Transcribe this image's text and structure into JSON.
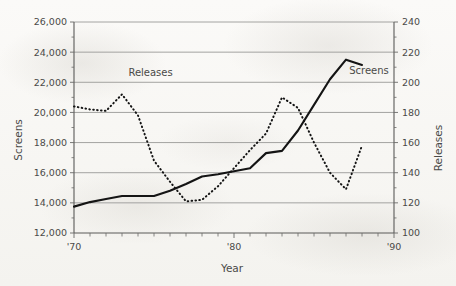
{
  "chart_data": {
    "type": "line",
    "title": "",
    "subtitle": "",
    "xlabel": "Year",
    "ylabel": "Screens",
    "y2label": "Releases",
    "grid": true,
    "legend_position": "inline-labels",
    "xlim": [
      1970,
      1990
    ],
    "ylim": [
      12000,
      26000
    ],
    "y2lim": [
      100,
      240
    ],
    "x_tick_labels": [
      "'70",
      "'80",
      "'90"
    ],
    "x_major_ticks": [
      1970,
      1980,
      1990
    ],
    "x_minor_ticks": [
      1971,
      1972,
      1973,
      1974,
      1975,
      1976,
      1977,
      1978,
      1979,
      1981,
      1982,
      1983,
      1984,
      1985,
      1986,
      1987,
      1988,
      1989
    ],
    "y_tick_labels": [
      "12,000",
      "14,000",
      "16,000",
      "18,000",
      "20,000",
      "22,000",
      "24,000",
      "26,000"
    ],
    "y_ticks": [
      12000,
      14000,
      16000,
      18000,
      20000,
      22000,
      24000,
      26000
    ],
    "y2_tick_labels": [
      "100",
      "120",
      "140",
      "160",
      "180",
      "200",
      "220",
      "240"
    ],
    "y2_ticks": [
      100,
      120,
      140,
      160,
      180,
      200,
      220,
      240
    ],
    "x": [
      1970,
      1971,
      1972,
      1973,
      1974,
      1975,
      1976,
      1977,
      1978,
      1979,
      1980,
      1981,
      1982,
      1983,
      1984,
      1985,
      1986,
      1987,
      1988
    ],
    "series": [
      {
        "name": "Screens",
        "axis": "left",
        "style": "solid",
        "label_text": "Screens",
        "values": [
          13750,
          14050,
          14250,
          14450,
          14450,
          14450,
          14800,
          15250,
          15750,
          15900,
          16100,
          16300,
          17300,
          17450,
          18800,
          20500,
          22200,
          23500,
          23150
        ]
      },
      {
        "name": "Releases",
        "axis": "right",
        "style": "dotted",
        "label_text": "Releases",
        "values": [
          184,
          182,
          181,
          192,
          178,
          148,
          134,
          121,
          122,
          131,
          143,
          155,
          166,
          190,
          183,
          160,
          140,
          129,
          158
        ]
      }
    ],
    "annotations": [
      {
        "text": "Releases",
        "x": 1973.4,
        "y2": 204
      },
      {
        "text": "Screens",
        "x": 1987.2,
        "y": 22550
      }
    ]
  },
  "axes": {
    "left_title": "Screens",
    "right_title": "Releases",
    "bottom_title": "Year"
  }
}
